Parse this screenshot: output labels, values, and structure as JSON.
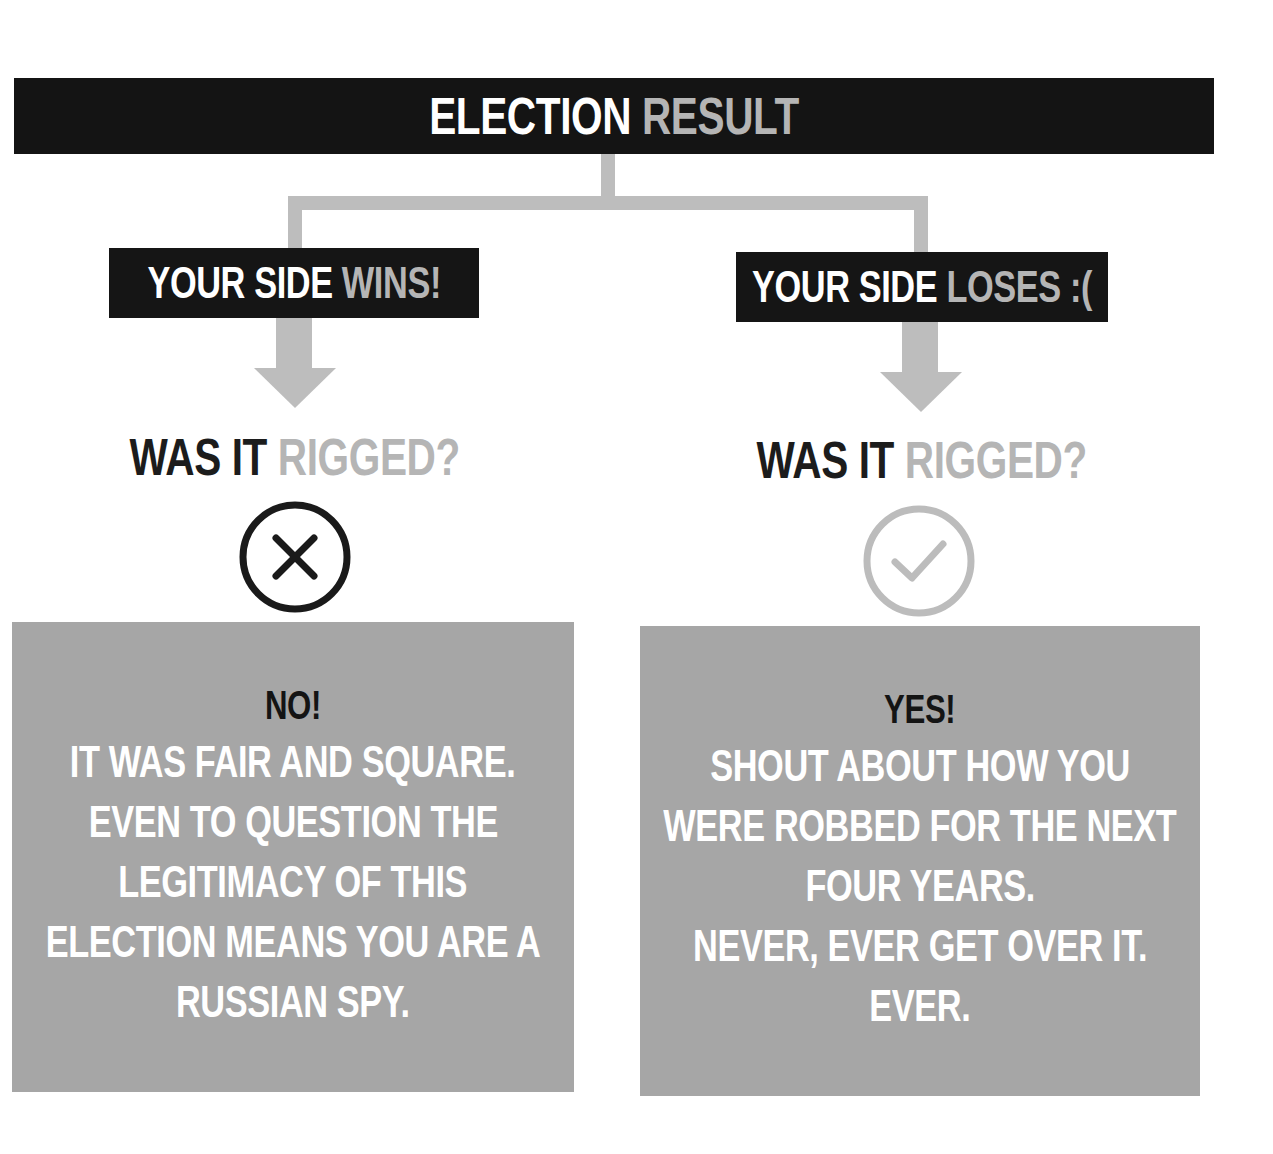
{
  "title": {
    "part1": "ELECTION",
    "part2": "RESULT"
  },
  "colors": {
    "dark": "#141414",
    "connector": "#bdbdbd",
    "highlight_gray": "#b5b5b5",
    "box_gray": "#a6a6a6",
    "white": "#ffffff"
  },
  "branches": [
    {
      "label_part1": "YOUR SIDE",
      "label_part2": "WINS!",
      "question_part1": "WAS IT",
      "question_part2": "RIGGED?",
      "icon": "x-circle-icon",
      "answer_head": "NO!",
      "answer_lines": [
        "IT WAS FAIR AND SQUARE.",
        "EVEN TO QUESTION THE",
        "LEGITIMACY OF THIS",
        "ELECTION MEANS YOU ARE A",
        "RUSSIAN SPY."
      ]
    },
    {
      "label_part1": "YOUR SIDE",
      "label_part2": "LOSES :(",
      "question_part1": "WAS IT",
      "question_part2": "RIGGED?",
      "icon": "check-circle-icon",
      "answer_head": "YES!",
      "answer_lines": [
        "SHOUT ABOUT HOW YOU",
        "WERE ROBBED FOR THE NEXT",
        "FOUR YEARS.",
        "NEVER, EVER GET OVER IT.",
        "EVER."
      ]
    }
  ]
}
